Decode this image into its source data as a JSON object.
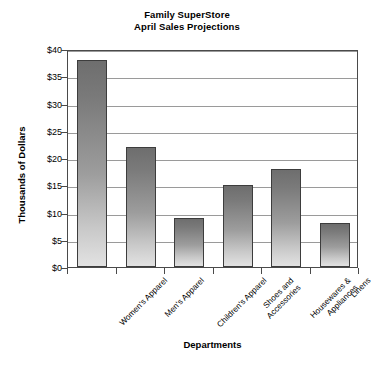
{
  "chart_data": {
    "type": "bar",
    "title": "Family SuperStore April Sales Projections",
    "title_lines": [
      "Family SuperStore",
      "April Sales Projections"
    ],
    "categories": [
      "Women's Apparel",
      "Men's Apparel",
      "Children's Apparel",
      "Shoes and Accessories",
      "Housewares & Appliances",
      "Linens"
    ],
    "category_lines": [
      [
        "Women's Apparel"
      ],
      [
        "Men's Apparel"
      ],
      [
        "Children's Apparel"
      ],
      [
        "Shoes and",
        "Accessories"
      ],
      [
        "Housewares &",
        "Appliances"
      ],
      [
        "Linens"
      ]
    ],
    "values": [
      38,
      22,
      9,
      15,
      18,
      8
    ],
    "xlabel": "Departments",
    "ylabel": "Thousands of Dollars",
    "ylim": [
      0,
      40
    ],
    "ytick_step": 5,
    "ytick_values": [
      0,
      5,
      10,
      15,
      20,
      25,
      30,
      35,
      40
    ],
    "ytick_labels": [
      "$0",
      "$5",
      "$10",
      "$15",
      "$20",
      "$25",
      "$30",
      "$35",
      "$40"
    ],
    "grid": true,
    "grid_axis": "y",
    "legend": false,
    "legend_position": "none",
    "units": "Thousands of Dollars",
    "colors": {
      "bar_top": "#6e6e6e",
      "bar_bottom": "#e2e2e2",
      "bar_border": "#3d3d3d",
      "gridline": "#9a9a9a",
      "axis": "#4a4a4a",
      "background": "#ffffff",
      "text": "#000000"
    }
  }
}
